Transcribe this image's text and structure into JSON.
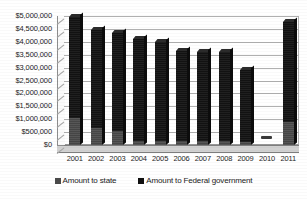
{
  "chart_data": {
    "type": "bar",
    "subtype": "stacked-column-3d",
    "title": "",
    "xlabel": "",
    "ylabel": "",
    "categories": [
      "2001",
      "2002",
      "2003",
      "2004",
      "2005",
      "2006",
      "2007",
      "2008",
      "2009",
      "2010",
      "2011"
    ],
    "series": [
      {
        "name": "Amount to state",
        "color": "#4a4a4a",
        "values": [
          1050000,
          650000,
          550000,
          150000,
          150000,
          150000,
          150000,
          150000,
          100000,
          0,
          900000
        ]
      },
      {
        "name": "Amount to Federal government",
        "color": "#101010",
        "values": [
          3900000,
          3800000,
          3800000,
          3950000,
          3850000,
          3500000,
          3450000,
          3450000,
          2800000,
          0,
          3850000
        ]
      }
    ],
    "totals": [
      4950000,
      4450000,
      4350000,
      4100000,
      4000000,
      3650000,
      3600000,
      3600000,
      2900000,
      0,
      4750000
    ],
    "ylim": [
      0,
      5000000
    ],
    "ytick_step": 500000,
    "ytick_labels": [
      "$5,000,000",
      "$4,500,000",
      "$4,000,000",
      "$3,500,000",
      "$3,000,000",
      "$2,500,000",
      "$2,000,000",
      "$1,500,000",
      "$1,000,000",
      "$500,000",
      "$0"
    ],
    "ytick_values": [
      5000000,
      4500000,
      4000000,
      3500000,
      3000000,
      2500000,
      2000000,
      1500000,
      1000000,
      500000,
      0
    ],
    "grid": true,
    "legend_position": "bottom",
    "legend": [
      {
        "label": "Amount to state",
        "swatch": "state"
      },
      {
        "label": "Amount to Federal government",
        "swatch": "federal"
      }
    ]
  }
}
